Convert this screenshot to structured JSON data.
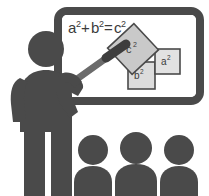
{
  "illustration": {
    "title": "Teacher at whiteboard explaining the Pythagorean theorem to three students",
    "alt_label": "pythagorean-theorem-classroom-pictogram"
  },
  "colors": {
    "figure": "#4a4a4a",
    "board_frame": "#4a4a4a",
    "board_surface": "#ffffff",
    "square_fill_c": "#c9c9c9",
    "square_fill_a": "#e2e2e2",
    "square_fill_b": "#dcdcdc",
    "square_stroke": "#4a4a4a",
    "formula_text": "#3b3b3b",
    "pointer_stick": "#6b6b6b",
    "pointer_grip": "#3d3d3d",
    "background": "#ffffff"
  },
  "whiteboard": {
    "name": "whiteboard",
    "formula": "a²+b²=c²",
    "formula_parts": {
      "a_base": "a",
      "a_exp": "2",
      "plus": "+",
      "b_base": "b",
      "b_exp": "2",
      "equals": "=",
      "c_base": "c",
      "c_exp": "2"
    }
  },
  "diagram": {
    "name": "pythagorean-diagram",
    "squares": [
      {
        "id": "c",
        "label": "c²",
        "label_base": "c",
        "label_exp": "2",
        "role": "hypotenuse-square",
        "rotation_deg": -45
      },
      {
        "id": "a",
        "label": "a²",
        "label_base": "a",
        "label_exp": "2",
        "role": "leg-square-right",
        "rotation_deg": 0
      },
      {
        "id": "b",
        "label": "b²",
        "label_base": "b",
        "label_exp": "2",
        "role": "leg-square-bottom",
        "rotation_deg": 0
      }
    ]
  },
  "teacher": {
    "name": "teacher-figure",
    "has_pointer": true,
    "pointer_label": "pointer-stick"
  },
  "audience": {
    "name": "students-row",
    "count": 3,
    "students": [
      {
        "id": 1,
        "label": "student-1"
      },
      {
        "id": 2,
        "label": "student-2"
      },
      {
        "id": 3,
        "label": "student-3"
      }
    ]
  }
}
